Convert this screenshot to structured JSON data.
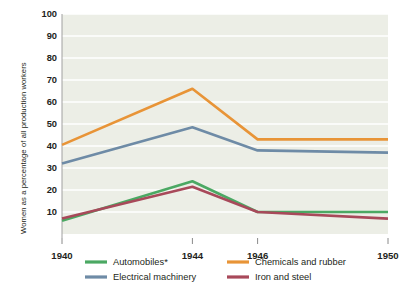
{
  "chart_data": {
    "type": "line",
    "title": "",
    "xlabel": "",
    "ylabel": "Women as a percentage of all production workers",
    "x": [
      1940,
      1944,
      1946,
      1950
    ],
    "xticklabels": [
      "1940",
      "1944",
      "1946",
      "1950"
    ],
    "yticks": [
      10,
      20,
      30,
      40,
      50,
      60,
      70,
      80,
      90,
      100
    ],
    "yticklabels": [
      "10",
      "20",
      "30",
      "40",
      "50",
      "60",
      "70",
      "80",
      "90",
      "100"
    ],
    "ylim": [
      0,
      100
    ],
    "grid": true,
    "legend_position": "bottom",
    "series": [
      {
        "name": "Automobiles*",
        "color": "#4ba863",
        "values": [
          6,
          24,
          10,
          10
        ]
      },
      {
        "name": "Electrical machinery",
        "color": "#6e8ba6",
        "values": [
          32,
          48.5,
          38,
          37
        ]
      },
      {
        "name": "Chemicals and rubber",
        "color": "#e89437",
        "values": [
          40.5,
          66,
          43,
          43
        ]
      },
      {
        "name": "Iron and steel",
        "color": "#a8495a",
        "values": [
          7,
          21.5,
          10,
          7
        ]
      }
    ]
  },
  "plot": {
    "background": "#eceee6",
    "gridline_color": "#ffffff",
    "axis_color": "#9a9a9a"
  },
  "legend": {
    "entries": [
      {
        "label": "Automobiles*",
        "color": "#4ba863"
      },
      {
        "label": "Chemicals and rubber",
        "color": "#e89437"
      },
      {
        "label": "Electrical machinery",
        "color": "#6e8ba6"
      },
      {
        "label": "Iron and steel",
        "color": "#a8495a"
      }
    ]
  }
}
